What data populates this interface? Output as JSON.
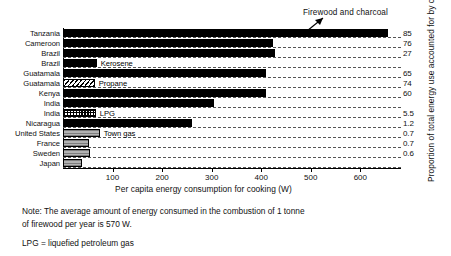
{
  "chart_data": {
    "type": "bar",
    "orientation": "horizontal",
    "title": "",
    "xlabel": "Per capita energy consumption for cooking (W)",
    "ylabel": "",
    "y2label": "Proportion of total energy use accounted for by cooking (%)",
    "xlim": [
      0,
      680
    ],
    "xticks": [
      100,
      200,
      300,
      400,
      500,
      600
    ],
    "xtick_labels": [
      "100",
      "200",
      "300",
      "400",
      "500",
      "600"
    ],
    "grid": "horizontal-dashed",
    "legend": "inline-labels",
    "categories": [
      "Tanzania",
      "Cameroon",
      "Brazil",
      "Brazil",
      "Guatamala",
      "Guatamala",
      "Kenya",
      "India",
      "India",
      "Nicaragua",
      "United States",
      "France",
      "Sweden",
      "Japan"
    ],
    "bars": [
      {
        "country": "Tanzania",
        "fuel": "Firewood and charcoal",
        "value": 655,
        "pattern": "solid",
        "tag": "",
        "percent": "85"
      },
      {
        "country": "Cameroon",
        "fuel": "Firewood and charcoal",
        "value": 424,
        "pattern": "solid",
        "tag": "",
        "percent": "76"
      },
      {
        "country": "Brazil",
        "fuel": "Firewood and charcoal",
        "value": 428,
        "pattern": "solid",
        "tag": "",
        "percent": "27"
      },
      {
        "country": "Brazil",
        "fuel": "Kerosene",
        "value": 68,
        "pattern": "solid",
        "tag": "Kerosene",
        "percent": ""
      },
      {
        "country": "Guatamala",
        "fuel": "Firewood and charcoal",
        "value": 410,
        "pattern": "solid",
        "tag": "",
        "percent": "65"
      },
      {
        "country": "Guatamala",
        "fuel": "Propane",
        "value": 64,
        "pattern": "hatch",
        "tag": "Propane",
        "percent": "74"
      },
      {
        "country": "Kenya",
        "fuel": "Firewood and charcoal",
        "value": 410,
        "pattern": "solid",
        "tag": "",
        "percent": "60"
      },
      {
        "country": "India",
        "fuel": "Firewood and charcoal",
        "value": 304,
        "pattern": "solid",
        "tag": "",
        "percent": ""
      },
      {
        "country": "India",
        "fuel": "LPG",
        "value": 66,
        "pattern": "check",
        "tag": "LPG",
        "percent": "5.5"
      },
      {
        "country": "Nicaragua",
        "fuel": "Firewood and charcoal",
        "value": 260,
        "pattern": "solid",
        "tag": "",
        "percent": "1.2"
      },
      {
        "country": "United States",
        "fuel": "Town gas",
        "value": 74,
        "pattern": "grey",
        "tag": "Town gas",
        "percent": "0.7"
      },
      {
        "country": "France",
        "fuel": "Town gas",
        "value": 52,
        "pattern": "grey",
        "tag": "",
        "percent": "0.7"
      },
      {
        "country": "Sweden",
        "fuel": "Town gas",
        "value": 54,
        "pattern": "grey",
        "tag": "",
        "percent": "0.6"
      },
      {
        "country": "Japan",
        "fuel": "Town gas",
        "value": 38,
        "pattern": "grey",
        "tag": "",
        "percent": ""
      }
    ],
    "annotations": [
      {
        "text": "Firewood and charcoal",
        "points_to": "Tanzania"
      }
    ]
  },
  "notes": {
    "line1": "Note: The average amount of energy consumed in the combustion of 1 tonne",
    "line2": "of firewood per year is 570 W.",
    "line3": "LPG = liquefied petroleum gas"
  }
}
